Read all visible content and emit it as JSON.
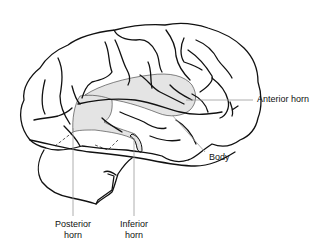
{
  "figure": {
    "colors": {
      "outline": "#111111",
      "ventricle_fill": "#e4e4e4",
      "leader_line": "#9a9a9a",
      "background": "#ffffff"
    }
  },
  "labels": {
    "anterior_horn": "Anterior horn",
    "body": "Body",
    "posterior_horn_line1": "Posterior",
    "posterior_horn_line2": "horn",
    "inferior_horn_line1": "Inferior",
    "inferior_horn_line2": "horn"
  }
}
